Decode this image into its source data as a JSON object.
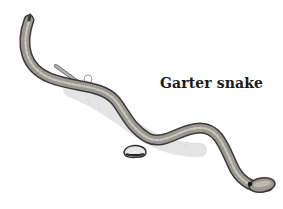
{
  "figure": {
    "label": "Garter snake",
    "style": "pencil sketch, grayscale",
    "colors": {
      "background": "#ffffff",
      "outline": "#3a3a3a",
      "body_fill": "#9a9890",
      "body_stripe": "#c9c6bb",
      "shadow": "#d8d8d8",
      "label_text": "#1a1a1a"
    }
  }
}
